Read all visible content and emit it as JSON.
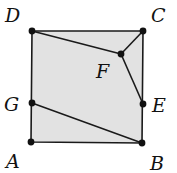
{
  "diagram": {
    "colors": {
      "fill": "#e2e2e2",
      "stroke": "#1a1a1a",
      "point": "#111111",
      "label": "#111111"
    },
    "points": {
      "A": {
        "label": "A",
        "x": 31,
        "y": 142,
        "lx": 6,
        "ly": 168
      },
      "B": {
        "label": "B",
        "x": 142,
        "y": 143,
        "lx": 150,
        "ly": 170
      },
      "C": {
        "label": "C",
        "x": 143,
        "y": 31,
        "lx": 151,
        "ly": 22
      },
      "D": {
        "label": "D",
        "x": 32,
        "y": 31,
        "lx": 5,
        "ly": 22
      },
      "E": {
        "label": "E",
        "x": 143,
        "y": 104,
        "lx": 152,
        "ly": 112
      },
      "F": {
        "label": "F",
        "x": 121,
        "y": 54,
        "lx": 96,
        "ly": 78
      },
      "G": {
        "label": "G",
        "x": 32,
        "y": 103,
        "lx": 4,
        "ly": 111
      }
    },
    "segments": [
      {
        "from": "D",
        "to": "F"
      },
      {
        "from": "F",
        "to": "C"
      },
      {
        "from": "F",
        "to": "E"
      },
      {
        "from": "G",
        "to": "B"
      }
    ],
    "shape": "square",
    "vertices_order": [
      "A",
      "B",
      "C",
      "D"
    ]
  }
}
